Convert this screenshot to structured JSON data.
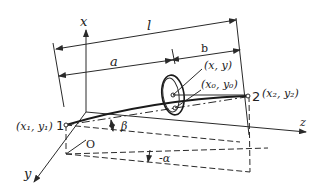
{
  "diagram": {
    "axes": {
      "x": "x",
      "y": "y",
      "z": "z",
      "origin": "O"
    },
    "dimensions": {
      "total_length": "l",
      "segment_a": "a",
      "segment_b": "b"
    },
    "points": {
      "p1_number": "1",
      "p1_coords": "(x₁, y₁)",
      "p2_number": "2",
      "p2_coords": "(x₂, y₂)",
      "section_point": "(x, y)",
      "center_point": "(x₀, y₀)"
    },
    "angles": {
      "beta": "β",
      "alpha": "-α"
    },
    "colors": {
      "line": "#2a2a2a",
      "background": "#ffffff"
    }
  }
}
